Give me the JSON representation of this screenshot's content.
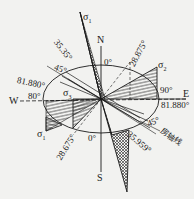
{
  "diagram": {
    "type": "stress-direction rose / compass diagram",
    "compass": {
      "north": "N",
      "south": "S",
      "east": "E",
      "west": "W"
    },
    "stress_labels": {
      "sigma1": "σ",
      "sigma1_sub": "1",
      "sigma2": "σ",
      "sigma2_sub": "2",
      "sigma3": "σ",
      "sigma3_sub": "3"
    },
    "angle_labels": {
      "top_zero": "0°",
      "bottom_zero": "0°",
      "east_ninety": "90°",
      "west_eighty": "80°",
      "upper_left_45": "45°",
      "lower_right_45": "45°",
      "angle_35_35": "35.35°",
      "angle_28_875": "28.875°",
      "angle_81_880_left": "81.880°",
      "angle_81_880_right": "81.880°",
      "angle_28_675": "28.675°",
      "angle_35_959": "35.959°"
    },
    "annotation": {
      "axis_line_label": "房轴线"
    },
    "colors": {
      "line": "#1a1a1a",
      "background": "#f2f2f0",
      "hatch": "#222222"
    }
  }
}
